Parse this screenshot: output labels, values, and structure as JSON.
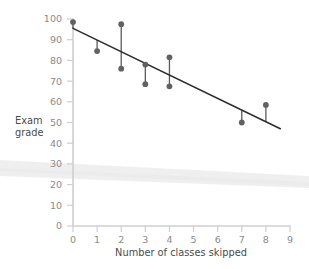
{
  "chart_data": {
    "type": "scatter",
    "title": "",
    "xlabel": "Number of classes skipped",
    "ylabel": "Exam grade",
    "xlim": [
      0,
      9
    ],
    "ylim": [
      0,
      100
    ],
    "xticks": [
      0,
      1,
      2,
      3,
      4,
      5,
      6,
      7,
      8,
      9
    ],
    "xtick_labels": [
      "0",
      "1",
      "2",
      "3",
      "4",
      "5",
      "6",
      "7",
      "8",
      "9"
    ],
    "yticks": [
      0,
      10,
      20,
      30,
      40,
      50,
      60,
      70,
      80,
      90,
      100
    ],
    "ytick_labels": [
      "0",
      "10",
      "20",
      "30",
      "40",
      "50",
      "60",
      "70",
      "80",
      "90",
      "100"
    ],
    "grid": false,
    "legend": null,
    "points": [
      {
        "x": 0,
        "y": 98.5
      },
      {
        "x": 1,
        "y": 84.5
      },
      {
        "x": 2,
        "y": 97.5
      },
      {
        "x": 2,
        "y": 76.0
      },
      {
        "x": 3,
        "y": 78.0
      },
      {
        "x": 3,
        "y": 68.5
      },
      {
        "x": 4,
        "y": 81.5
      },
      {
        "x": 4,
        "y": 67.5
      },
      {
        "x": 7,
        "y": 50.0
      },
      {
        "x": 8,
        "y": 58.5
      }
    ],
    "regression_line": {
      "x_start": 0,
      "y_start": 95.5,
      "x_end": 8.6,
      "y_end": 47.0,
      "slope": -5.64,
      "intercept": 95.5
    },
    "residuals": [
      {
        "x": 0,
        "y_point": 98.5,
        "y_fit": 95.5
      },
      {
        "x": 1,
        "y_point": 84.5,
        "y_fit": 89.9
      },
      {
        "x": 2,
        "y_point": 97.5,
        "y_fit": 84.2
      },
      {
        "x": 2,
        "y_point": 76.0,
        "y_fit": 84.2
      },
      {
        "x": 3,
        "y_point": 78.0,
        "y_fit": 78.6
      },
      {
        "x": 3,
        "y_point": 68.5,
        "y_fit": 78.6
      },
      {
        "x": 4,
        "y_point": 81.5,
        "y_fit": 72.9
      },
      {
        "x": 4,
        "y_point": 67.5,
        "y_fit": 72.9
      },
      {
        "x": 7,
        "y_point": 50.0,
        "y_fit": 56.0
      },
      {
        "x": 8,
        "y_point": 58.5,
        "y_fit": 50.4
      }
    ],
    "colors": {
      "point": "#616161",
      "fit_line": "#2b2b2b",
      "residual_line": "#5a5a5a",
      "axis": "#cfcfcf",
      "tick_label": "#8a8a8a",
      "axis_title": "#4a4a4a",
      "background": "#ffffff"
    }
  },
  "y_axis_title": {
    "line1": "Exam",
    "line2": "grade"
  },
  "x_axis_title": "Number of classes skipped"
}
